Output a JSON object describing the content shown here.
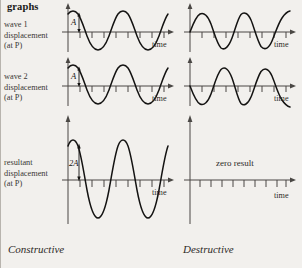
{
  "heading": "graphs",
  "rows": [
    {
      "label_lines": [
        "wave 1",
        "displacement",
        "(at P)"
      ],
      "left": {
        "amplitude_label": "A",
        "time_label": "time",
        "wave_type": "cosine",
        "amplitude": "A",
        "cycles": 2.25,
        "ticks": 8
      },
      "right": {
        "amplitude_label": "",
        "time_label": "time",
        "wave_type": "sine",
        "amplitude": "A",
        "cycles": 2.25,
        "ticks": 8
      }
    },
    {
      "label_lines": [
        "wave 2",
        "displacement",
        "(at P)"
      ],
      "left": {
        "amplitude_label": "A",
        "time_label": "time",
        "wave_type": "cosine",
        "amplitude": "A",
        "cycles": 2.25,
        "ticks": 8
      },
      "right": {
        "amplitude_label": "",
        "time_label": "time",
        "wave_type": "inverted-sine",
        "amplitude": "A",
        "cycles": 2.25,
        "ticks": 8
      }
    },
    {
      "label_lines": [
        "resultant",
        "displacement",
        "(at P)"
      ],
      "left": {
        "amplitude_label": "2A",
        "time_label": "time",
        "wave_type": "cosine",
        "amplitude": "2A",
        "cycles": 2.25,
        "ticks": 8
      },
      "right": {
        "amplitude_label": "",
        "time_label": "time",
        "wave_type": "flat",
        "amplitude": "0",
        "zero_text": "zero result",
        "ticks": 9
      }
    }
  ],
  "captions": {
    "left": "Constructive",
    "right": "Destructive"
  },
  "colors": {
    "background": "#f2f0ed",
    "wave": "#141312",
    "axis": "#4a4744",
    "text": "#2d2a27",
    "border": "#b8b4ae"
  }
}
